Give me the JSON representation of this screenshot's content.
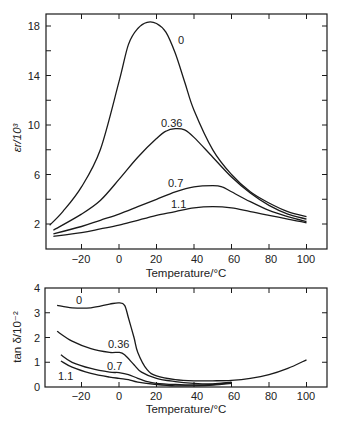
{
  "chart_data": [
    {
      "type": "line",
      "title": "",
      "xlabel": "Temperature/°C",
      "ylabel": "εr/10³",
      "xlim": [
        -38,
        110
      ],
      "ylim": [
        0,
        19
      ],
      "xticks": [
        -20,
        0,
        20,
        40,
        60,
        80,
        100
      ],
      "yticks_labeled": [
        2,
        6,
        10,
        14,
        18
      ],
      "yticks_minor": [
        4,
        8,
        12,
        16
      ],
      "grid": false,
      "legend": "inline curve labels",
      "series": [
        {
          "name": "0",
          "x": [
            -37,
            -30,
            -20,
            -10,
            0,
            5,
            10,
            15,
            20,
            25,
            30,
            35,
            40,
            50,
            60,
            70,
            80,
            90,
            100
          ],
          "y": [
            1.9,
            3.0,
            5.0,
            8.0,
            13.5,
            16.5,
            17.8,
            18.3,
            18.2,
            17.5,
            15.8,
            13.5,
            11.2,
            8.0,
            6.0,
            4.6,
            3.7,
            3.0,
            2.6
          ]
        },
        {
          "name": "0.36",
          "x": [
            -35,
            -20,
            -10,
            0,
            10,
            20,
            25,
            30,
            35,
            40,
            50,
            60,
            70,
            80,
            90,
            100
          ],
          "y": [
            1.5,
            2.8,
            3.9,
            5.6,
            7.4,
            8.9,
            9.5,
            9.7,
            9.6,
            9.0,
            7.4,
            5.8,
            4.5,
            3.5,
            2.8,
            2.4
          ]
        },
        {
          "name": "0.7",
          "x": [
            -35,
            -20,
            -10,
            0,
            10,
            20,
            30,
            40,
            50,
            55,
            60,
            70,
            80,
            90,
            100
          ],
          "y": [
            1.2,
            1.8,
            2.3,
            2.8,
            3.4,
            4.0,
            4.6,
            5.0,
            5.1,
            5.0,
            4.6,
            3.8,
            3.1,
            2.6,
            2.2
          ]
        },
        {
          "name": "1.1",
          "x": [
            -35,
            -20,
            -10,
            0,
            10,
            20,
            30,
            40,
            50,
            60,
            70,
            80,
            90,
            100
          ],
          "y": [
            1.0,
            1.3,
            1.6,
            1.9,
            2.3,
            2.7,
            3.0,
            3.3,
            3.4,
            3.3,
            3.0,
            2.7,
            2.4,
            2.1
          ]
        }
      ]
    },
    {
      "type": "line",
      "title": "",
      "xlabel": "Temperature/°C",
      "ylabel": "tan δ/10⁻²",
      "xlim": [
        -38,
        110
      ],
      "ylim": [
        0,
        4
      ],
      "xticks": [
        -20,
        0,
        20,
        40,
        60,
        80,
        100
      ],
      "yticks": [
        0,
        1,
        2,
        3,
        4
      ],
      "grid": false,
      "legend": "inline curve labels",
      "series": [
        {
          "name": "0",
          "x": [
            -33,
            -25,
            -15,
            -5,
            0,
            3,
            5,
            8,
            10,
            15,
            20,
            30,
            40,
            50,
            60,
            70,
            80,
            90,
            100
          ],
          "y": [
            3.3,
            3.2,
            3.2,
            3.35,
            3.4,
            3.3,
            2.8,
            2.0,
            1.4,
            0.7,
            0.45,
            0.3,
            0.25,
            0.25,
            0.27,
            0.35,
            0.5,
            0.75,
            1.1
          ]
        },
        {
          "name": "0.36",
          "x": [
            -33,
            -25,
            -15,
            -5,
            0,
            3,
            8,
            12,
            20,
            30,
            40,
            50,
            60
          ],
          "y": [
            2.25,
            1.85,
            1.55,
            1.4,
            1.4,
            1.3,
            0.9,
            0.6,
            0.35,
            0.22,
            0.15,
            0.13,
            0.2
          ]
        },
        {
          "name": "0.7",
          "x": [
            -31,
            -25,
            -15,
            -5,
            0,
            5,
            10,
            15,
            20,
            30,
            40,
            50,
            60
          ],
          "y": [
            1.3,
            1.0,
            0.75,
            0.6,
            0.58,
            0.5,
            0.35,
            0.22,
            0.15,
            0.1,
            0.08,
            0.1,
            0.18
          ]
        },
        {
          "name": "1.1",
          "x": [
            -31,
            -25,
            -15,
            -5,
            0,
            5,
            10,
            20,
            30,
            40,
            50,
            60
          ],
          "y": [
            1.05,
            0.8,
            0.55,
            0.4,
            0.35,
            0.3,
            0.2,
            0.1,
            0.05,
            0.05,
            0.08,
            0.15
          ]
        }
      ]
    }
  ],
  "top_chart": {
    "ylabel": "εr/10³",
    "xlabel": "Temperature/°C",
    "ytick_labels": [
      "18",
      "14",
      "10",
      "6",
      "2"
    ],
    "xtick_labels": [
      "−20",
      "0",
      "20",
      "40",
      "60",
      "80",
      "100"
    ],
    "curve_labels": [
      "0",
      "0.36",
      "0.7",
      "1.1"
    ]
  },
  "bottom_chart": {
    "ylabel": "tan δ/10⁻²",
    "xlabel": "Temperature/°C",
    "ytick_labels": [
      "4",
      "3",
      "2",
      "1",
      "0"
    ],
    "xtick_labels": [
      "−20",
      "0",
      "20",
      "40",
      "60",
      "80",
      "100"
    ],
    "curve_labels": [
      "0",
      "0.36",
      "0.7",
      "1.1"
    ]
  }
}
